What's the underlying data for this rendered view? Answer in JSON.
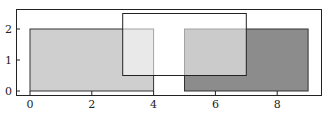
{
  "chart_data": {
    "type": "rectangles",
    "title": "",
    "xlabel": "",
    "ylabel": "",
    "xlim": [
      -0.45,
      9.4
    ],
    "ylim": [
      -0.1,
      2.65
    ],
    "grid": false,
    "legend": null,
    "xticks": [
      0,
      2,
      4,
      6,
      8
    ],
    "yticks": [
      0,
      1,
      2
    ],
    "xtick_labels": [
      "0",
      "2",
      "4",
      "6",
      "8"
    ],
    "ytick_labels": [
      "0",
      "1",
      "2"
    ],
    "shapes": [
      {
        "name": "light-rectangle",
        "x": 0,
        "y": 0,
        "width": 4,
        "height": 2,
        "fill": "#cfcfcf",
        "edgecolor": "#333333",
        "alpha": 1.0
      },
      {
        "name": "dark-rectangle",
        "x": 5,
        "y": 0,
        "width": 4,
        "height": 2,
        "fill": "#8c8c8c",
        "edgecolor": "#333333",
        "alpha": 1.0
      },
      {
        "name": "overlay-rectangle",
        "x": 3,
        "y": 0.5,
        "width": 4,
        "height": 2,
        "fill": "#ffffff",
        "edgecolor": "#222222",
        "alpha": 0.55
      }
    ]
  },
  "frame": {
    "left": 16,
    "top": 9,
    "right": 321,
    "bottom": 95
  },
  "mapping": {
    "x0_px": 30,
    "px_per_x": 30.9,
    "y0_px": 91,
    "px_per_y": 31
  }
}
